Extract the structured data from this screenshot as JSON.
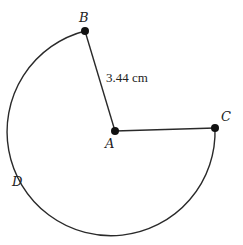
{
  "diagram": {
    "type": "circle-sector",
    "center": {
      "label": "A",
      "x": 115,
      "y": 131
    },
    "points": [
      {
        "label": "B",
        "x": 85,
        "y": 31
      },
      {
        "label": "C",
        "x": 215,
        "y": 128
      },
      {
        "label": "D"
      }
    ],
    "radius_label": "3.44 cm",
    "arc": "major arc BDC",
    "colors": {
      "stroke": "#2a2a2a",
      "point": "#111111"
    }
  }
}
